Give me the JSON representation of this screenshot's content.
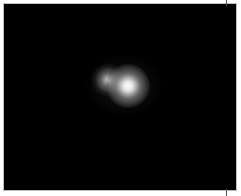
{
  "image": {
    "description": "Dark field image with two bright diffuse spots",
    "background_color": "#000000",
    "border_color": "#bdbdbd",
    "spots": [
      {
        "name": "dim-spot",
        "center_x": 105,
        "center_y": 78,
        "intensity": "medium"
      },
      {
        "name": "bright-spot",
        "center_x": 126,
        "center_y": 84,
        "intensity": "high"
      }
    ]
  }
}
